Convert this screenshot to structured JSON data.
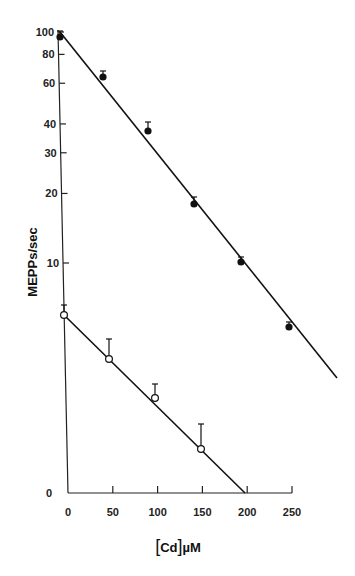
{
  "chart_data": {
    "type": "scatter",
    "title": "",
    "xlabel": "[Cd]µM",
    "ylabel": "MEPPs/sec",
    "xlim": [
      0,
      250
    ],
    "x_ticks": [
      "0",
      "50",
      "100",
      "150",
      "200",
      "250"
    ],
    "y_ticks": [
      "100",
      "80",
      "60",
      "40",
      "30",
      "20",
      "10",
      "0"
    ],
    "y_scale": "log",
    "series": [
      {
        "name": "filled circles",
        "marker": "filled-circle",
        "x": [
          0,
          40,
          90,
          145,
          195,
          250
        ],
        "y": [
          95,
          64,
          37,
          18,
          10,
          5.3
        ],
        "fit_line": {
          "x": [
            0,
            280
          ],
          "y": [
            100,
            3.3
          ]
        }
      },
      {
        "name": "open circles",
        "marker": "open-circle",
        "x": [
          0,
          50,
          100,
          150
        ],
        "y": [
          6,
          3.8,
          2.6,
          1.6
        ],
        "fit_line": {
          "x": [
            0,
            200
          ],
          "y": [
            6,
            0
          ]
        }
      }
    ]
  },
  "labels": {
    "ylabel": "MEPPs/sec",
    "xlabel_bracket_open": "[",
    "xlabel_species": "Cd",
    "xlabel_bracket_close": "]",
    "xlabel_unit": "µM"
  }
}
